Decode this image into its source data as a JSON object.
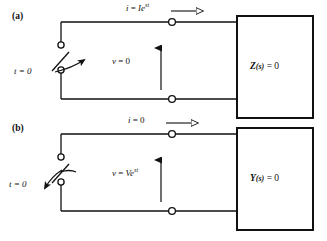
{
  "figure": {
    "panels": [
      {
        "id": "a",
        "letter": "(a)",
        "switch_label": "t = 0",
        "switch_action": "closing",
        "current_label": {
          "var": "i",
          "equals": "=",
          "value": "Ie",
          "exponent": "st",
          "full": "i = Ie^st"
        },
        "voltage_label": {
          "var": "v",
          "equals": "=",
          "value": "0",
          "full": "v = 0"
        },
        "network_box": {
          "symbol": "Z",
          "argument": "(s)",
          "relation": "= 0",
          "full": "Z(s) = 0"
        }
      },
      {
        "id": "b",
        "letter": "(b)",
        "switch_label": "t = 0",
        "switch_action": "opening",
        "current_label": {
          "var": "i",
          "equals": "=",
          "value": "0",
          "exponent": "",
          "full": "i = 0"
        },
        "voltage_label": {
          "var": "v",
          "equals": "=",
          "value": "Ve",
          "exponent": "st",
          "full": "v = Ve^st"
        },
        "network_box": {
          "symbol": "Y",
          "argument": "(s)",
          "relation": "= 0",
          "full": "Y(s) = 0"
        }
      }
    ],
    "colors": {
      "ink": "#111111",
      "background": "#ffffff"
    }
  }
}
